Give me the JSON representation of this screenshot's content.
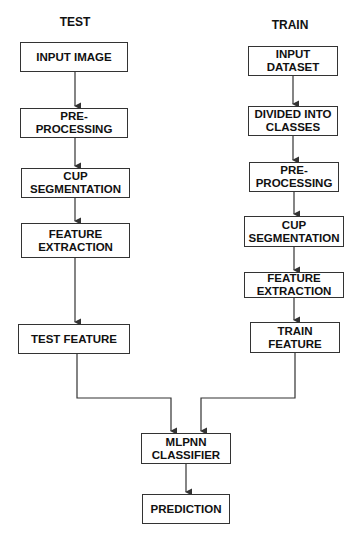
{
  "columns": {
    "test": {
      "title": "TEST",
      "steps": [
        "INPUT IMAGE",
        "PRE-\nPROCESSING",
        "CUP\nSEGMENTATION",
        "FEATURE\nEXTRACTION",
        "TEST FEATURE"
      ]
    },
    "train": {
      "title": "TRAIN",
      "steps": [
        "INPUT\nDATASET",
        "DIVIDED INTO\nCLASSES",
        "PRE-\nPROCESSING",
        "CUP\nSEGMENTATION",
        "FEATURE\nEXTRACTION",
        "TRAIN\nFEATURE"
      ]
    }
  },
  "merge": {
    "classifier": "MLPNN\nCLASSIFIER",
    "output": "PREDICTION"
  },
  "colors": {
    "stroke": "#333333",
    "text": "#111111",
    "background": "#ffffff"
  }
}
